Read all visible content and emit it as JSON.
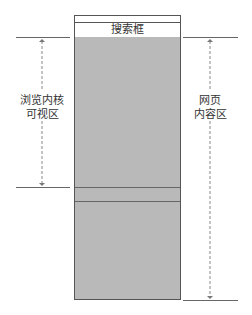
{
  "diagram": {
    "search_box_label": "搜索框",
    "left_label": [
      "浏览内核",
      "可视区"
    ],
    "right_label": [
      "网页",
      "内容区"
    ],
    "colors": {
      "content_fill": "#b9b9b9",
      "outline": "#555555",
      "dashed": "#888888"
    }
  }
}
